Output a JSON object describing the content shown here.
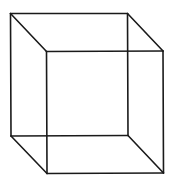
{
  "diagram": {
    "type": "wireframe-cube",
    "stroke_color": "#1a1a1a",
    "stroke_width": 1.6,
    "background": "#ffffff",
    "vertices": {
      "back_top_left": [
        10.5,
        13.5
      ],
      "back_top_right": [
        127.5,
        13.5
      ],
      "back_bottom_left": [
        11,
        136
      ],
      "back_bottom_right": [
        128,
        135.5
      ],
      "front_top_left": [
        46.5,
        51.5
      ],
      "front_top_right": [
        163,
        51
      ],
      "front_bottom_left": [
        47,
        173.5
      ],
      "front_bottom_right": [
        163.5,
        173
      ]
    },
    "edges": [
      [
        "back_top_left",
        "back_top_right"
      ],
      [
        "back_top_right",
        "back_bottom_right"
      ],
      [
        "back_bottom_right",
        "back_bottom_left"
      ],
      [
        "back_bottom_left",
        "back_top_left"
      ],
      [
        "front_top_left",
        "front_top_right"
      ],
      [
        "front_top_right",
        "front_bottom_right"
      ],
      [
        "front_bottom_right",
        "front_bottom_left"
      ],
      [
        "front_bottom_left",
        "front_top_left"
      ],
      [
        "back_top_left",
        "front_top_left"
      ],
      [
        "back_top_right",
        "front_top_right"
      ],
      [
        "back_bottom_left",
        "front_bottom_left"
      ],
      [
        "back_bottom_right",
        "front_bottom_right"
      ]
    ]
  }
}
